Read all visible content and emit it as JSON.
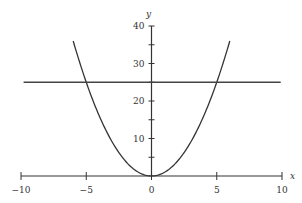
{
  "chart_data": {
    "type": "line",
    "title": "",
    "xlabel": "x",
    "ylabel": "y",
    "xlim": [
      -10,
      10
    ],
    "ylim": [
      0,
      40
    ],
    "x_ticks": [
      -10,
      -5,
      0,
      5,
      10
    ],
    "x_tick_labels": [
      "−10",
      "−5",
      "0",
      "5",
      "10"
    ],
    "y_ticks": [
      5,
      10,
      15,
      20,
      25,
      30,
      35,
      40
    ],
    "y_tick_labels": [
      "10",
      "20",
      "30",
      "40"
    ],
    "y_labeled_ticks": [
      10,
      20,
      30,
      40
    ],
    "grid": false,
    "legend": null,
    "series": [
      {
        "name": "y = x^2",
        "x": [
          -6,
          -5,
          -4,
          -3,
          -2,
          -1,
          0,
          1,
          2,
          3,
          4,
          5,
          6
        ],
        "values": [
          36,
          25,
          16,
          9,
          4,
          1,
          0,
          1,
          4,
          9,
          16,
          25,
          36
        ]
      },
      {
        "name": "y = 25",
        "x": [
          -9.8,
          9.9
        ],
        "values": [
          25,
          25
        ]
      }
    ]
  }
}
